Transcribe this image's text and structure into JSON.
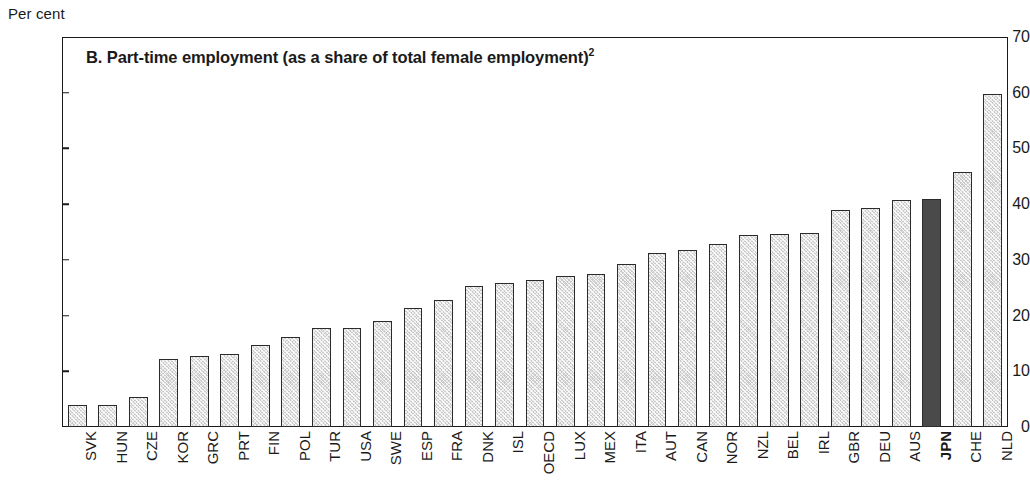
{
  "axis_unit_caption": "Per cent",
  "panel": {
    "title_prefix": "B. Part-time employment (as a share of total female employment)",
    "title_footnote": "2"
  },
  "chart_data": {
    "type": "bar",
    "title": "B. Part-time employment (as a share of total female employment)2",
    "xlabel": "",
    "ylabel": "Per cent",
    "ylim": [
      0,
      70
    ],
    "yticks": [
      0,
      10,
      20,
      30,
      40,
      50,
      60,
      70
    ],
    "grid": false,
    "legend": false,
    "highlight_category": "JPN",
    "colors": {
      "bar_fill": "#c9c9c9",
      "bar_border": "#2b2b2b",
      "highlight_fill": "#4a4a4a",
      "axis": "#1a1a1a",
      "background": "#ffffff"
    },
    "categories": [
      "SVK",
      "HUN",
      "CZE",
      "KOR",
      "GRC",
      "PRT",
      "FIN",
      "POL",
      "TUR",
      "USA",
      "SWE",
      "ESP",
      "FRA",
      "DNK",
      "ISL",
      "OECD",
      "LUX",
      "MEX",
      "ITA",
      "AUT",
      "CAN",
      "NOR",
      "NZL",
      "BEL",
      "IRL",
      "GBR",
      "DEU",
      "AUS",
      "JPN",
      "CHE",
      "NLD"
    ],
    "values": [
      4.0,
      4.0,
      5.3,
      12.2,
      12.8,
      13.1,
      14.8,
      16.2,
      17.7,
      17.7,
      19.0,
      21.4,
      22.8,
      25.4,
      25.8,
      26.3,
      27.1,
      27.5,
      29.3,
      31.2,
      31.7,
      32.8,
      34.4,
      34.6,
      34.9,
      39.0,
      39.3,
      40.7,
      40.9,
      45.7,
      59.8
    ]
  }
}
